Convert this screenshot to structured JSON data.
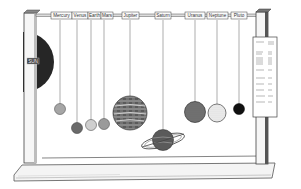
{
  "diagram": {
    "type": "solar-system-mobile-model",
    "sun": {
      "label": "SUN",
      "color": "#2a2a2a"
    },
    "planets": [
      {
        "name": "Mercury",
        "label_x": 62,
        "string_x": 60,
        "ball_cy": 109,
        "r": 5.5,
        "fill": "#a8a8a8"
      },
      {
        "name": "Venus",
        "label_x": 80,
        "string_x": 77,
        "ball_cy": 128,
        "r": 5.5,
        "fill": "#6e6e6e"
      },
      {
        "name": "Earth",
        "label_x": 95,
        "string_x": 91,
        "ball_cy": 125,
        "r": 5.5,
        "fill": "#c8c8c8"
      },
      {
        "name": "Mars",
        "label_x": 108,
        "string_x": 104,
        "ball_cy": 124,
        "r": 5.5,
        "fill": "#999999"
      },
      {
        "name": "Jupiter",
        "label_x": 130,
        "string_x": 130,
        "ball_cy": 113,
        "r": 17,
        "fill": "#666666"
      },
      {
        "name": "Saturn",
        "label_x": 163,
        "string_x": 163,
        "ball_cy": 140,
        "r": 11,
        "fill": "#555555"
      },
      {
        "name": "Uranus",
        "label_x": 196,
        "string_x": 195,
        "ball_cy": 112,
        "r": 10.5,
        "fill": "#707070"
      },
      {
        "name": "Neptune",
        "label_x": 218,
        "string_x": 217,
        "ball_cy": 113,
        "r": 9,
        "fill": "#dedede"
      },
      {
        "name": "Pluto",
        "label_x": 239,
        "string_x": 239,
        "ball_cy": 109,
        "r": 5.5,
        "fill": "#111111"
      }
    ],
    "info_panel": {
      "present": true,
      "text_legible": false
    }
  }
}
